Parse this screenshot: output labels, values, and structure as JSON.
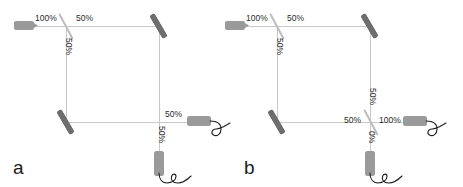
{
  "figure": {
    "accent_beam_color": "#c9c9c9",
    "mirror_color": "#6e6e6e",
    "splitter_color": "#bdbdbd",
    "device_color": "#9a9a9a",
    "wire_color": "#1f1f1f",
    "text_color": "#2b2b2b"
  },
  "panels": [
    {
      "id": "a",
      "label": "a",
      "components": {
        "laser": "laser-source",
        "beam_splitter_count": 1,
        "mirror_count": 2,
        "detector_count": 2
      },
      "labels": {
        "input_100": "100%",
        "top_50": "50%",
        "left_50": "50%",
        "out_right_50": "50%",
        "out_bottom_50": "50%"
      }
    },
    {
      "id": "b",
      "label": "b",
      "components": {
        "laser": "laser-source",
        "beam_splitter_count": 2,
        "mirror_count": 2,
        "detector_count": 2
      },
      "labels": {
        "input_100": "100%",
        "top_50": "50%",
        "left_50": "50%",
        "right_arm_50": "50%",
        "bottom_in_50": "50%",
        "out_right_100": "100%",
        "out_bottom_0": "0%"
      }
    }
  ]
}
